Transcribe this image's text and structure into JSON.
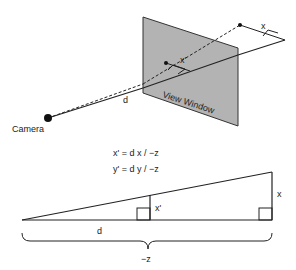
{
  "diagram": {
    "top": {
      "camera_label": "Camera",
      "window_label": "View Window",
      "d_label": "d",
      "x_label": "x",
      "xprime_label": "x'"
    },
    "equations": {
      "line1": "x' = d x / −z",
      "line2": "y' = d y / −z"
    },
    "bottom": {
      "x_label": "x",
      "xprime_label": "x'",
      "d_label": "d",
      "negz_label": "−z"
    },
    "colors": {
      "window_fill": "#b3b3b3",
      "stroke": "#222222"
    }
  }
}
